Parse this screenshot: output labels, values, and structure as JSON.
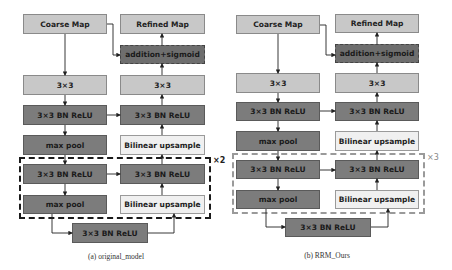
{
  "diagrams": [
    {
      "caption": "(a) original_model",
      "repeat_label": "×2",
      "boxes": {
        "coarse_map": "Coarse Map",
        "refined_map": "Refined Map",
        "addition_sigmoid": "addition+sigmoid",
        "enc_conv": "3×3",
        "dec_conv": "3×3",
        "enc_bn1": "3×3 BN ReLU",
        "dec_bn1": "3×3 BN ReLU",
        "enc_pool1": "max pool",
        "dec_up1": "Bilinear upsample",
        "enc_bn2": "3×3 BN ReLU",
        "dec_bn2": "3×3 BN ReLU",
        "enc_pool2": "max pool",
        "dec_up2": "Bilinear upsample",
        "bottleneck": "3×3 BN ReLU"
      }
    },
    {
      "caption": "(b) RRM_Ours",
      "repeat_label": "×3",
      "boxes": {
        "coarse_map": "Coarse Map",
        "refined_map": "Refined Map",
        "addition_sigmoid": "addition+sigmoid",
        "enc_conv": "3×3",
        "dec_conv": "3×3",
        "enc_bn1": "3×3 BN ReLU",
        "dec_bn1": "3×3 BN ReLU",
        "enc_pool1": "max pool",
        "dec_up1": "Bilinear upsample",
        "enc_bn2": "3×3 BN ReLU",
        "dec_bn2": "3×3 BN ReLU",
        "enc_pool2": "max pool",
        "dec_up2": "Bilinear upsample",
        "bottleneck": "3×3 BN ReLU"
      }
    }
  ],
  "colors": {
    "light_block": "#c8c8c8",
    "dark_block": "#7c7c7c",
    "pale_block": "#f0f0f0",
    "addition_block": "#6e6e6e"
  }
}
